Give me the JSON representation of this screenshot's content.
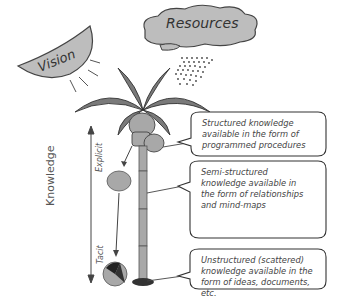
{
  "diagram": {
    "vision_label": "Vision",
    "resources_label": "Resources",
    "knowledge_label": "Knowledge",
    "explicit_label": "Explicit",
    "tacit_label": "Tacit",
    "boxes": [
      {
        "text": "Structured knowledge available in the form of programmed procedures"
      },
      {
        "text": "Semi-structured knowledge available in the form of relationships and mind-maps"
      },
      {
        "text": "Unstructured (scattered) knowledge available in the form of ideas, documents, etc."
      }
    ],
    "colors": {
      "fill_gray": "#b8b8b8",
      "leaf_dark": "#6e6e6e",
      "outline": "#333333"
    }
  }
}
